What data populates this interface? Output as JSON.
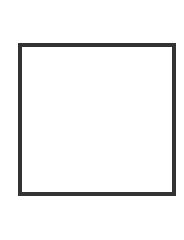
{
  "canvas": {
    "width": 184,
    "height": 197,
    "background": "#ffffff"
  },
  "shape": {
    "type": "square-outline",
    "stroke_color": "#333333",
    "fill_color": "#ffffff"
  }
}
